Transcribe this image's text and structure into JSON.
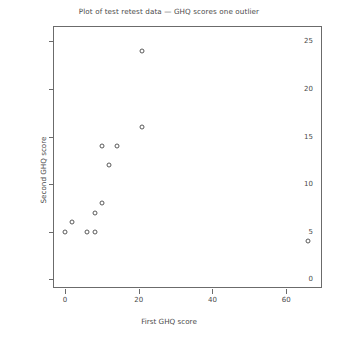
{
  "chart_data": {
    "type": "scatter",
    "title": "Plot of test retest data — GHQ scores one outlier",
    "xlabel": "First GHQ score",
    "ylabel": "Second GHQ score",
    "xlim": [
      -3,
      70
    ],
    "ylim": [
      -1,
      26.5
    ],
    "xticks": [
      0,
      20,
      40,
      60
    ],
    "yticks": [
      0,
      5,
      10,
      15,
      20,
      25
    ],
    "xticklabels": [
      "0",
      "20",
      "40",
      "60"
    ],
    "yticklabels": [
      "0",
      "5",
      "10",
      "15",
      "20",
      "25"
    ],
    "grid": false,
    "legend": null,
    "marker": "open-circle",
    "marker_color": "#595959",
    "series": [
      {
        "name": "GHQ test retest",
        "points": [
          {
            "x": 0,
            "y": 5
          },
          {
            "x": 2,
            "y": 6
          },
          {
            "x": 6,
            "y": 5
          },
          {
            "x": 8,
            "y": 5
          },
          {
            "x": 8,
            "y": 7
          },
          {
            "x": 10,
            "y": 8
          },
          {
            "x": 12,
            "y": 12
          },
          {
            "x": 10,
            "y": 14
          },
          {
            "x": 14,
            "y": 14
          },
          {
            "x": 21,
            "y": 16
          },
          {
            "x": 21,
            "y": 24
          },
          {
            "x": 66,
            "y": 4
          }
        ]
      }
    ],
    "annotations": []
  }
}
